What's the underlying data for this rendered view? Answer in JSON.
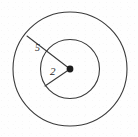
{
  "figure": {
    "type": "geometry-diagram",
    "background_color": "#fefefe",
    "stroke_color": "#3a3a3a",
    "label_color": "#2b2b2b",
    "labels": {
      "outer_radius": "5",
      "inner_radius": "2"
    },
    "center_point": {
      "name": "center-dot",
      "x": 70,
      "y": 69
    },
    "circles": [
      {
        "name": "outer-circle",
        "cx": 70,
        "cy": 69,
        "r": 57,
        "label": "5"
      },
      {
        "name": "inner-circle",
        "cx": 70,
        "cy": 69,
        "r": 29.5,
        "label": "2"
      }
    ],
    "radius_lines": [
      {
        "name": "outer-radius-line",
        "x1": 70,
        "y1": 69,
        "x2": 27,
        "y2": 36,
        "label": "5"
      },
      {
        "name": "inner-radius-line",
        "x1": 70,
        "y1": 69,
        "x2": 45,
        "y2": 86,
        "label": "2"
      }
    ]
  }
}
